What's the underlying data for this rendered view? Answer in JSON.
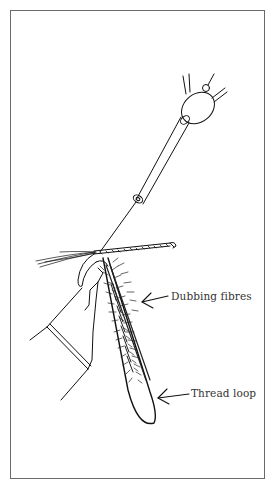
{
  "figure": {
    "type": "line-illustration",
    "border_color": "#6a6a6a",
    "ink_color": "#111111",
    "background": "#ffffff"
  },
  "labels": {
    "dubbing": "Dubbing fibres",
    "thread_loop": "Thread loop"
  },
  "parts": [
    {
      "id": "spinner-tool",
      "name": "dubbing spinner"
    },
    {
      "id": "bobbin-tube",
      "name": "bobbin holder tube"
    },
    {
      "id": "hook",
      "name": "fly hook"
    },
    {
      "id": "vice-jaws",
      "name": "vice jaws"
    },
    {
      "id": "tail-fibres",
      "name": "tail fibres"
    },
    {
      "id": "dubbing-fibres",
      "name": "dubbing fibres"
    },
    {
      "id": "thread-loop",
      "name": "thread loop"
    }
  ]
}
